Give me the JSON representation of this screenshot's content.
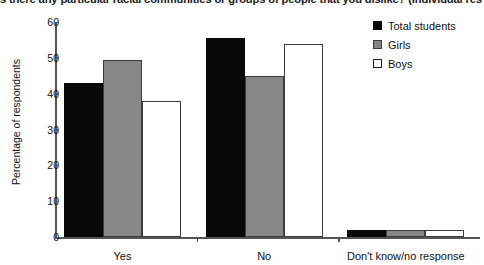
{
  "chart_data": {
    "type": "bar",
    "title": "s there any particular racial communities or groups of people that you dislike? (Individual res",
    "xlabel": "",
    "ylabel": "Percentage of respondents",
    "ylim": [
      0,
      60
    ],
    "yticks": [
      0,
      10,
      20,
      30,
      40,
      50,
      60
    ],
    "grid": false,
    "legend_position": "top-right",
    "categories": [
      "Yes",
      "No",
      "Don't know/no response"
    ],
    "series": [
      {
        "name": "Total students",
        "color": "#080808",
        "values": [
          43,
          55.5,
          2
        ]
      },
      {
        "name": "Girls",
        "color": "#878787",
        "values": [
          49.5,
          45,
          2
        ]
      },
      {
        "name": "Boys",
        "color": "#ffffff",
        "values": [
          38,
          54,
          2
        ]
      }
    ]
  },
  "axis": {
    "tick_labels": [
      "60",
      "50",
      "40",
      "30",
      "20",
      "10",
      "0"
    ]
  }
}
